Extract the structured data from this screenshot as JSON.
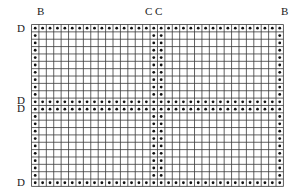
{
  "diagram": {
    "type": "dotted-grid-chart",
    "columns": 34,
    "rows": 22,
    "cell_width": 7.41,
    "cell_height": 7.36,
    "colors": {
      "grid_line": "#3a3a3a",
      "dot": "#111111",
      "background": "#ffffff"
    },
    "dotted_rows": [
      0,
      10,
      11,
      21
    ],
    "dotted_columns": [
      0,
      16,
      17,
      33
    ]
  },
  "labels": {
    "top": [
      {
        "id": "b-left",
        "text": "B",
        "x": 37,
        "y": 6
      },
      {
        "id": "c-left",
        "text": "C",
        "x": 145,
        "y": 6
      },
      {
        "id": "c-right",
        "text": "C",
        "x": 155,
        "y": 6
      },
      {
        "id": "b-right",
        "text": "B",
        "x": 281,
        "y": 6
      }
    ],
    "left": [
      {
        "id": "d-top",
        "text": "D",
        "x": 17,
        "y": 23
      },
      {
        "id": "d-mid-upper",
        "text": "D",
        "x": 17,
        "y": 95
      },
      {
        "id": "d-mid-lower",
        "text": "D",
        "x": 17,
        "y": 103
      },
      {
        "id": "d-bottom",
        "text": "D",
        "x": 17,
        "y": 177
      }
    ]
  }
}
